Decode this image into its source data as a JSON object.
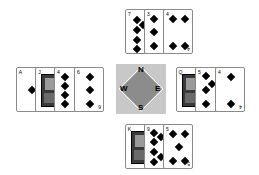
{
  "compass": {
    "north": "N",
    "south": "S",
    "east": "E",
    "west": "W",
    "colors": {
      "outer": "#c8c8c8",
      "inner": "#8c8c8c"
    }
  },
  "hands": {
    "north": {
      "position": {
        "left": 125,
        "top": 9
      },
      "cards": [
        {
          "rank": "7",
          "suit": "diamonds",
          "pips": 5
        },
        {
          "rank": "3",
          "suit": "diamonds",
          "pips": 3
        },
        {
          "rank": "4",
          "suit": "diamonds",
          "pips": 4
        }
      ]
    },
    "west": {
      "position": {
        "left": 16,
        "top": 67
      },
      "cards": [
        {
          "rank": "A",
          "suit": "diamonds",
          "pips": 1
        },
        {
          "rank": "J",
          "suit": "diamonds",
          "pips": 0,
          "face": true
        },
        {
          "rank": "4",
          "suit": "diamonds",
          "pips": 4
        },
        {
          "rank": "6",
          "suit": "diamonds",
          "pips": 6
        }
      ]
    },
    "east": {
      "position": {
        "left": 176,
        "top": 67
      },
      "cards": [
        {
          "rank": "Q",
          "suit": "diamonds",
          "pips": 0,
          "face": true
        },
        {
          "rank": "5",
          "suit": "diamonds",
          "pips": 5
        },
        {
          "rank": "4",
          "suit": "diamonds",
          "pips": 4
        }
      ]
    },
    "south": {
      "position": {
        "left": 125,
        "top": 124
      },
      "cards": [
        {
          "rank": "K",
          "suit": "diamonds",
          "pips": 0,
          "face": true
        },
        {
          "rank": "9",
          "suit": "diamonds",
          "pips": 9
        },
        {
          "rank": "5",
          "suit": "diamonds",
          "pips": 5
        }
      ]
    }
  }
}
